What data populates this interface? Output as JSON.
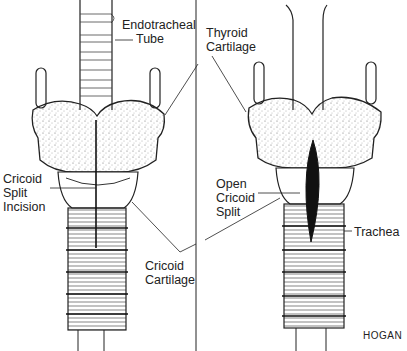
{
  "figure": {
    "signature": "HOGAN",
    "colors": {
      "ink": "#1a1a1a",
      "paper": "#ffffff",
      "stipple": "#555555"
    }
  },
  "left_panel": {
    "labels": {
      "endotracheal_tube": [
        "Endotracheal",
        "Tube"
      ],
      "cricoid_split_incision": [
        "Cricoid",
        "Split",
        "Incision"
      ],
      "cricoid_cartilage": [
        "Cricoid",
        "Cartilage"
      ]
    }
  },
  "center_labels": {
    "thyroid_cartilage": [
      "Thyroid",
      "Cartilage"
    ]
  },
  "right_panel": {
    "labels": {
      "open_cricoid_split": [
        "Open",
        "Cricoid",
        "Split"
      ],
      "trachea": [
        "Trachea"
      ]
    }
  }
}
